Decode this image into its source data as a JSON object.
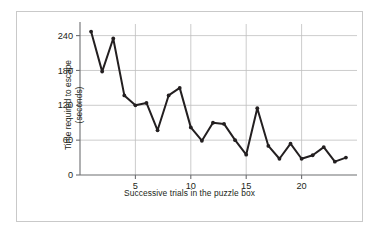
{
  "chart_data": {
    "type": "line",
    "title": "",
    "subtitle": "",
    "xlabel": "Successive trials in the puzzle box",
    "ylabel": "Time required to escape (seconds)",
    "ylabel_line1": "Time required to escape",
    "ylabel_line2": "(seconds)",
    "x": [
      1,
      2,
      3,
      4,
      5,
      6,
      7,
      8,
      9,
      10,
      11,
      12,
      13,
      14,
      15,
      16,
      17,
      18,
      19,
      20,
      21,
      22,
      23,
      24
    ],
    "values": [
      247,
      178,
      235,
      137,
      120,
      124,
      77,
      137,
      150,
      82,
      59,
      90,
      88,
      60,
      35,
      115,
      50,
      28,
      54,
      28,
      34,
      48,
      23,
      30
    ],
    "series": [
      {
        "name": "Escape time",
        "values": [
          247,
          178,
          235,
          137,
          120,
          124,
          77,
          137,
          150,
          82,
          59,
          90,
          88,
          60,
          35,
          115,
          50,
          28,
          54,
          28,
          34,
          48,
          23,
          30
        ]
      }
    ],
    "xlim": [
      0,
      25
    ],
    "ylim": [
      0,
      260
    ],
    "xticks": [
      5,
      10,
      15,
      20
    ],
    "xtick_labels": [
      "5",
      "10",
      "15",
      "20"
    ],
    "yticks": [
      0,
      60,
      120,
      180,
      240
    ],
    "ytick_labels": [
      "0",
      "60",
      "120",
      "180",
      "240"
    ],
    "grid": true,
    "grid_axis": "y",
    "legend": false,
    "legend_position": "none",
    "line_color": "#231f20",
    "marker": "circle",
    "marker_color": "#231f20",
    "grid_color": "#bfbfbf",
    "axis_color": "#6d6e71",
    "background_color": "#ffffff",
    "frame_color": "#c9c9c9"
  }
}
